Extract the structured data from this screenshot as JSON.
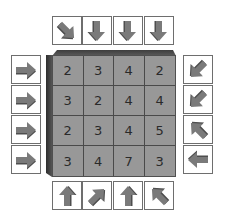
{
  "colors": {
    "cell_fill": "#989898",
    "bevel": "#4a4a4a",
    "arrow_fill": "#7a7a7a",
    "arrow_shadow": "#4e4e4e",
    "box_border": "#6e6e6e"
  },
  "puzzle": {
    "grid": [
      [
        2,
        3,
        4,
        2
      ],
      [
        3,
        2,
        4,
        4
      ],
      [
        2,
        3,
        4,
        5
      ],
      [
        3,
        4,
        7,
        3
      ]
    ],
    "cells": [
      "2",
      "3",
      "4",
      "2",
      "3",
      "2",
      "4",
      "4",
      "2",
      "3",
      "4",
      "5",
      "3",
      "4",
      "7",
      "3"
    ],
    "top_arrows": [
      "down-right",
      "down",
      "down",
      "down"
    ],
    "left_arrows": [
      "right",
      "right",
      "right",
      "right"
    ],
    "right_arrows": [
      "down-left",
      "down-left",
      "up-left",
      "left"
    ],
    "bottom_arrows": [
      "up",
      "up-right",
      "up",
      "up-left"
    ]
  }
}
